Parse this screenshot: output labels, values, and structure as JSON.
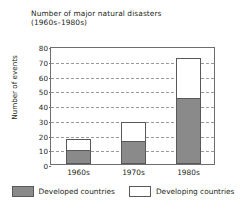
{
  "chart_data": {
    "type": "bar",
    "subtype": "stacked-bar",
    "title": "Number of major natural disasters",
    "subtitle": "(1960s–1980s)",
    "xlabel": "",
    "ylabel": "Number of events",
    "categories": [
      "1960s",
      "1970s",
      "1980s"
    ],
    "ylim": [
      0,
      80
    ],
    "yticks": [
      0,
      10,
      20,
      30,
      40,
      50,
      60,
      70,
      80
    ],
    "ytick_labels": [
      "0",
      "10",
      "20",
      "30",
      "40",
      "50",
      "60",
      "70",
      "80"
    ],
    "grid": "horizontal-dashed",
    "legend_position": "bottom",
    "series": [
      {
        "name": "Developed countries",
        "color": "#8a8a8a",
        "values": [
          9,
          15,
          44
        ]
      },
      {
        "name": "Developing countries",
        "color": "#ffffff",
        "values": [
          7,
          13,
          27
        ]
      }
    ],
    "totals": [
      16,
      28,
      71
    ]
  },
  "legend": {
    "items": [
      {
        "label": "Developed countries",
        "swatch": "developed"
      },
      {
        "label": "Developing countries",
        "swatch": "developing"
      }
    ]
  }
}
